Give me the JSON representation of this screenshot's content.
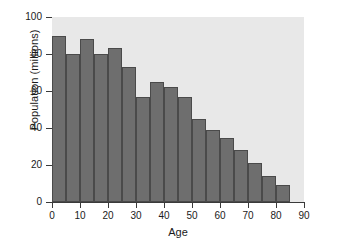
{
  "chart_data": {
    "type": "bar",
    "title": "",
    "subtitle": "",
    "xlabel": "Age",
    "ylabel": "Population (millions)",
    "xlim": [
      0,
      90
    ],
    "ylim": [
      0,
      100
    ],
    "grid": false,
    "legend": null,
    "bin_width": 5,
    "bar_color": "#6e6e6e",
    "plot_background": "#e8e8e8",
    "axis_color": "#3a3a3a",
    "xticks": [
      0,
      10,
      20,
      30,
      40,
      50,
      60,
      70,
      80,
      90
    ],
    "xtick_labels": [
      "0",
      "10",
      "20",
      "30",
      "40",
      "50",
      "60",
      "70",
      "80",
      "90"
    ],
    "yticks": [
      0,
      20,
      40,
      60,
      80,
      100
    ],
    "ytick_labels": [
      "0",
      "20",
      "40",
      "60",
      "80",
      "100"
    ],
    "categories": [
      "0-5",
      "5-10",
      "10-15",
      "15-20",
      "20-25",
      "25-30",
      "30-35",
      "35-40",
      "40-45",
      "45-50",
      "50-55",
      "55-60",
      "60-65",
      "65-70",
      "70-75",
      "75-80",
      "80-85"
    ],
    "bin_starts": [
      0,
      5,
      10,
      15,
      20,
      25,
      30,
      35,
      40,
      45,
      50,
      55,
      60,
      65,
      70,
      75,
      80
    ],
    "values": [
      90,
      80,
      88,
      80,
      83,
      73,
      57,
      65,
      62,
      57,
      45,
      39,
      34.5,
      28,
      21,
      14,
      9
    ]
  }
}
